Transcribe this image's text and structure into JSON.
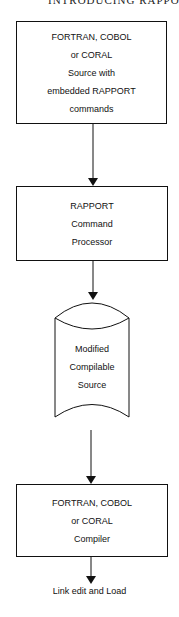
{
  "header": {
    "text": "INTRODUCING RAPPORT"
  },
  "nodes": [
    {
      "id": "source",
      "shape": "rectangle",
      "lines": [
        "FORTRAN, COBOL",
        "or CORAL",
        "Source with",
        "embedded RAPPORT",
        "commands"
      ]
    },
    {
      "id": "processor",
      "shape": "rectangle",
      "lines": [
        "RAPPORT",
        "Command",
        "Processor"
      ]
    },
    {
      "id": "modified",
      "shape": "cylinder",
      "lines": [
        "Modified",
        "Compilable",
        "Source"
      ]
    },
    {
      "id": "compiler",
      "shape": "rectangle",
      "lines": [
        "FORTRAN, COBOL",
        "or CORAL",
        "Compiler"
      ]
    }
  ],
  "terminal": {
    "text": "Link edit and Load"
  },
  "edges": [
    {
      "from": "source",
      "to": "processor"
    },
    {
      "from": "processor",
      "to": "modified"
    },
    {
      "from": "modified",
      "to": "compiler"
    },
    {
      "from": "compiler",
      "to": "terminal"
    }
  ],
  "colors": {
    "stroke": "#111111",
    "background": "#ffffff"
  }
}
